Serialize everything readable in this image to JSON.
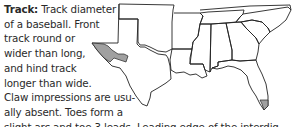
{
  "section": {
    "label": "Track:",
    "lines": [
      " Track diameter",
      "of a baseball. Front",
      "track round or",
      "wider than long,",
      "and hind track",
      "longer than wide.",
      "Claw impressions are usu-",
      "ally absent. Toes form a",
      "slight arc and toe 3 leads. Leading edge of the interdig-"
    ]
  },
  "range_map": {
    "region": "Southern United States",
    "outline_color": "#222222",
    "range_fill_color": "#a0a0a0",
    "range_areas": [
      "West Texas",
      "Southern tip of Florida"
    ]
  }
}
